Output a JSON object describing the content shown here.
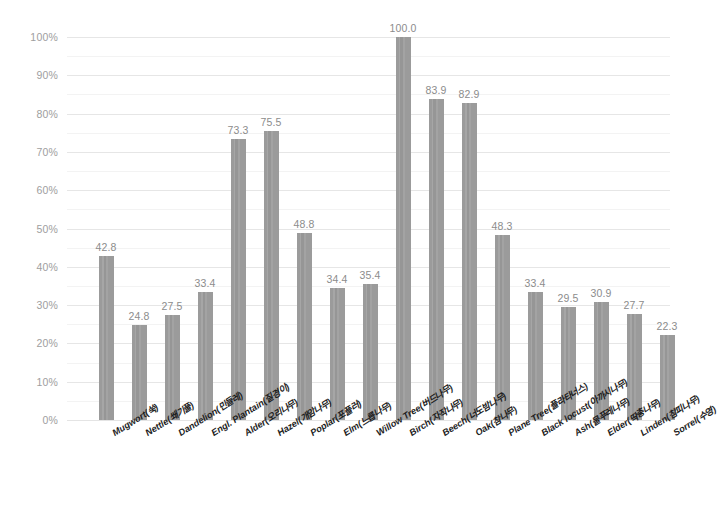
{
  "chart_data": {
    "type": "bar",
    "title": "",
    "subtitle": "",
    "xlabel": "",
    "ylabel": "",
    "ylim": [
      0,
      100
    ],
    "grid": true,
    "legend_position": "none",
    "bar_color": "#9b9b9b",
    "value_label_color": "#8c8c8c",
    "axis_label_color": "#9e9e9e",
    "gridline_color": "#ededed",
    "y_ticks": [
      "0%",
      "10%",
      "20%",
      "30%",
      "40%",
      "50%",
      "60%",
      "70%",
      "80%",
      "90%",
      "100%"
    ],
    "y_tick_values": [
      0,
      10,
      20,
      30,
      40,
      50,
      60,
      70,
      80,
      90,
      100
    ],
    "y_minor_step": 5,
    "categories": [
      "Mugwort(쑥)",
      "Nettle(쐐기풀)",
      "Dandelion(민들레)",
      "Engl. Plantain(질경이)",
      "Alder(오리나무)",
      "Hazel(개암나무)",
      "Poplar(포플러)",
      "Elm(느릅나무)",
      "Willow Tree(버드나무)",
      "Birch(자작나무)",
      "Beech(너도밤나무)",
      "Oak(참나무)",
      "Plane Tree(플라타너스)",
      "Black locust(아까시나무)",
      "Ash(물푸레나무)",
      "Elder(딱총나무)",
      "Linden(참피나무)",
      "Sorrel(수영)"
    ],
    "values": [
      42.8,
      24.8,
      27.5,
      33.4,
      73.3,
      75.5,
      48.8,
      34.4,
      35.4,
      100.0,
      83.9,
      82.9,
      48.3,
      33.4,
      29.5,
      30.9,
      27.7,
      22.3
    ],
    "value_labels": [
      "42.8",
      "24.8",
      "27.5",
      "33.4",
      "73.3",
      "75.5",
      "48.8",
      "34.4",
      "35.4",
      "100.0",
      "83.9",
      "82.9",
      "48.3",
      "33.4",
      "29.5",
      "30.9",
      "27.7",
      "22.3"
    ]
  }
}
